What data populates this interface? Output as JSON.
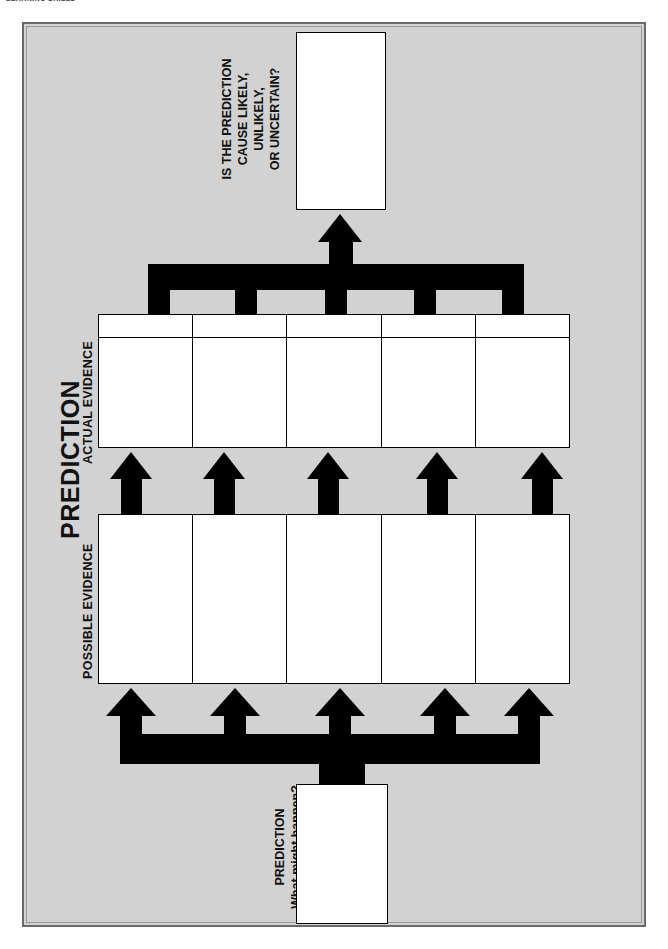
{
  "page": {
    "running_head": "LEARNING SKILLS",
    "background_color": "#d2d2d2",
    "ink_color": "#000000",
    "paper_color": "#ffffff"
  },
  "diagram": {
    "type": "flow-organizer",
    "title": "PREDICTION",
    "direction": "bottom-to-top",
    "stages": [
      {
        "id": "prediction-start",
        "label": "PREDICTION",
        "sublabel": "What might happen?",
        "shape": "box",
        "fill_count": 1
      },
      {
        "id": "possible-evidence",
        "label": "POSSIBLE EVIDENCE",
        "shape": "grid",
        "columns": 5,
        "has_header_row": false
      },
      {
        "id": "actual-evidence",
        "label": "ACTUAL EVIDENCE",
        "shape": "grid",
        "columns": 5,
        "has_header_row": true
      },
      {
        "id": "conclusion",
        "label": "IS THE PREDICTION CAUSE LIKELY, UNLIKELY, OR UNCERTAIN?",
        "label_lines": [
          "IS THE PREDICTION",
          "CAUSE LIKELY,",
          "UNLIKELY,",
          "OR UNCERTAIN?"
        ],
        "shape": "box",
        "fill_count": 1
      }
    ],
    "connectors": [
      {
        "id": "fan-out-bottom",
        "kind": "one-to-many",
        "arrows": 5,
        "from": "prediction-start",
        "to": "possible-evidence"
      },
      {
        "id": "column-arrows-middle",
        "kind": "parallel",
        "arrows": 5,
        "from": "possible-evidence",
        "to": "actual-evidence"
      },
      {
        "id": "fan-in-top",
        "kind": "many-to-one",
        "arrows": 1,
        "from": "actual-evidence",
        "to": "conclusion"
      }
    ]
  },
  "labels": {
    "title": "PREDICTION",
    "actual_evidence": "ACTUAL EVIDENCE",
    "possible_evidence": "POSSIBLE EVIDENCE",
    "conclusion_l1": "IS THE PREDICTION",
    "conclusion_l2": "CAUSE LIKELY,",
    "conclusion_l3": "UNLIKELY,",
    "conclusion_l4": "OR UNCERTAIN?",
    "start_l1": "PREDICTION",
    "start_l2": "What might happen?"
  }
}
